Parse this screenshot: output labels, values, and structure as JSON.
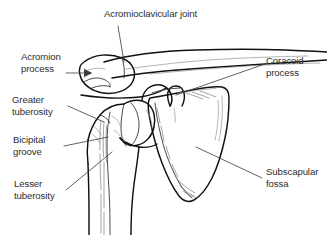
{
  "figure": {
    "view": "anterior view of right shoulder girdle",
    "background_color": "#ffffff",
    "line_color": "#111111",
    "text_color": "#2e2e2e"
  },
  "labels": {
    "acromioclavicular_joint": "Acromioclavicular joint",
    "acromion_process_line1": "Acromion",
    "acromion_process_line2": "process",
    "greater_tuberosity_line1": "Greater",
    "greater_tuberosity_line2": "tuberosity",
    "bicipital_groove_line1": "Bicipital",
    "bicipital_groove_line2": "groove",
    "lesser_tuberosity_line1": "Lesser",
    "lesser_tuberosity_line2": "tuberosity",
    "coracoid_process_line1": "Coracoid",
    "coracoid_process_line2": "process",
    "subscapular_fossa_line1": "Subscapular",
    "subscapular_fossa_line2": "fossa"
  },
  "structures": [
    {
      "name": "acromioclavicular-joint",
      "side": "top"
    },
    {
      "name": "acromion-process",
      "side": "left"
    },
    {
      "name": "greater-tuberosity",
      "side": "left"
    },
    {
      "name": "bicipital-groove",
      "side": "left"
    },
    {
      "name": "lesser-tuberosity",
      "side": "left"
    },
    {
      "name": "coracoid-process",
      "side": "right"
    },
    {
      "name": "subscapular-fossa",
      "side": "right"
    }
  ]
}
